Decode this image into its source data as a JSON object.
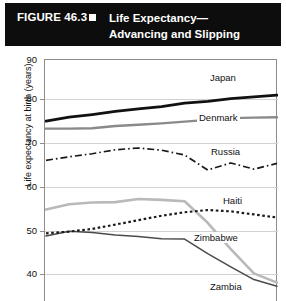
{
  "banner": {
    "figure_label": "FIGURE 46.3",
    "bullet_icon": "square-bullet-icon",
    "title_line1": "Life Expectancy—",
    "title_line2": "Advancing and Slipping"
  },
  "axis": {
    "ylabel": "Life expectancy at birth (years)",
    "yticks": [
      "90",
      "80",
      "70",
      "60",
      "50",
      "40"
    ]
  },
  "series_labels": {
    "japan": "Japan",
    "denmark": "Denmark",
    "russia": "Russia",
    "haiti": "Haiti",
    "zimbabwe": "Zimbabwe",
    "zambia": "Zambia"
  },
  "colors": {
    "japan": "#111111",
    "denmark": "#8a8a8a",
    "russia": "#1a1a1a",
    "haiti": "#1a1a1a",
    "zimbabwe": "#b9b9b9",
    "zambia": "#4a4a4a",
    "grid": "#d2d2d2",
    "frame": "#8d8d8d",
    "banner_bg": "#0d0d0d",
    "banner_fg": "#ffffff"
  },
  "chart_data": {
    "type": "line",
    "xlabel": "",
    "ylabel": "Life expectancy at birth (years)",
    "ylim": [
      35,
      90
    ],
    "yticks": [
      40,
      50,
      60,
      70,
      80,
      90
    ],
    "grid": true,
    "legend": "inline-right-labels",
    "x": [
      0,
      1,
      2,
      3,
      4,
      5,
      6,
      7,
      8,
      9,
      10
    ],
    "series": [
      {
        "name": "Japan",
        "style": "solid-thick-black",
        "values": [
          76.1,
          77.0,
          77.6,
          78.3,
          78.9,
          79.4,
          80.2,
          80.6,
          81.2,
          81.6,
          82.0
        ]
      },
      {
        "name": "Denmark",
        "style": "solid-gray",
        "values": [
          74.4,
          74.4,
          74.5,
          75.0,
          75.3,
          75.6,
          76.0,
          76.4,
          76.8,
          76.9,
          77.0
        ]
      },
      {
        "name": "Russia",
        "style": "dash-dot-black",
        "values": [
          67.2,
          68.0,
          68.7,
          69.6,
          70.0,
          69.5,
          68.4,
          65.0,
          66.6,
          65.2,
          66.5
        ]
      },
      {
        "name": "Haiti",
        "style": "dotted-black",
        "values": [
          50.6,
          51.0,
          51.6,
          52.6,
          53.6,
          54.6,
          55.4,
          55.9,
          55.6,
          54.9,
          54.2
        ]
      },
      {
        "name": "Zimbabwe",
        "style": "solid-light-gray",
        "values": [
          56.0,
          57.2,
          57.6,
          57.7,
          58.4,
          58.2,
          57.9,
          53.0,
          47.0,
          41.5,
          39.4
        ]
      },
      {
        "name": "Zambia",
        "style": "solid-thin-dark",
        "values": [
          50.0,
          51.1,
          50.8,
          50.2,
          49.9,
          49.4,
          49.3,
          46.0,
          43.0,
          40.1,
          38.6
        ]
      }
    ]
  }
}
